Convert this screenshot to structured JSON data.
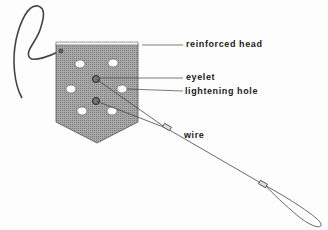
{
  "diagram": {
    "labels": {
      "reinforced_head": "reinforced head",
      "eyelet": "eyelet",
      "lightening_hole": "lightening hole",
      "wire": "wire"
    },
    "colors": {
      "flag_fill": "#9a9a9a",
      "line": "#333333",
      "hole": "#ffffff"
    }
  }
}
